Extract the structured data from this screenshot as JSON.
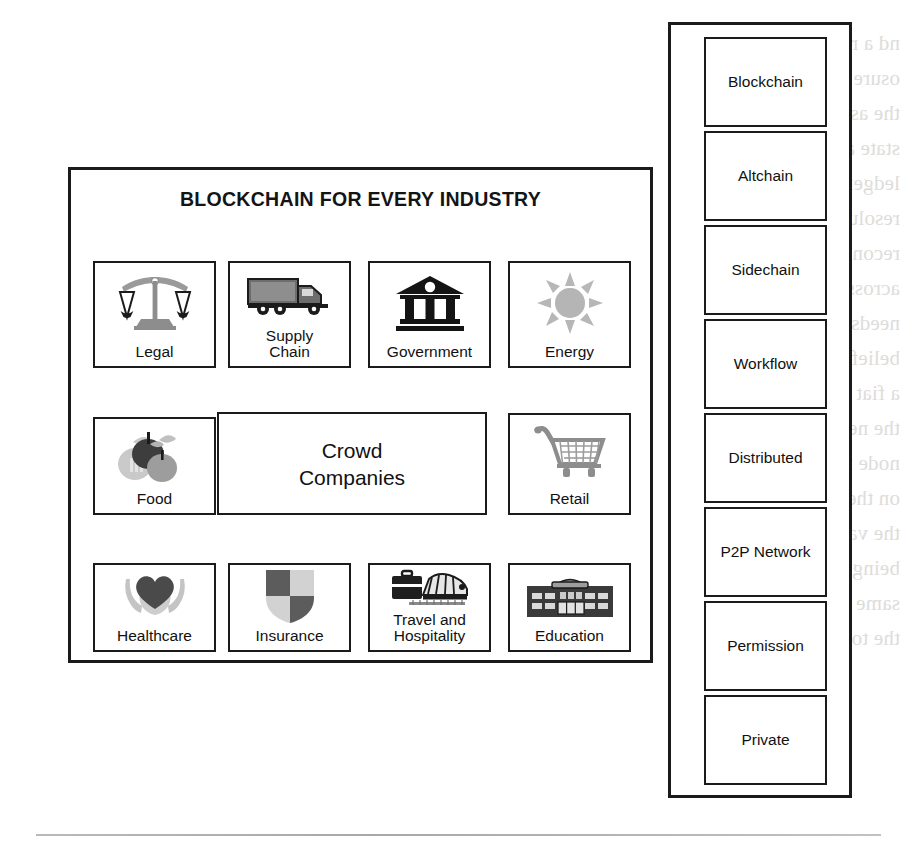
{
  "page": {
    "background_color": "#ffffff",
    "ink_color": "#1b1b1b",
    "ghost_text_color": "#d9d7d4",
    "ghost_text_right": "nd a reconciliation\nosure that traces\nthe asset and its\nstate across each\nledger. Token\nresolution and\nreconciliation\nacross partners\nneeds a common\nbelief system like\na fiat currency of\nthe network. Each\nnode must agree\non the state and\nthe value that is\nbeing settled. The\nsame applies for\nthe token itself.",
    "ghost_text_mid": "objects that are required to build a ledger\nensuring cross-ledger token resolution and\nreconciliation across the partners in a\nnetwork. A common belief system like a fiat\ncurrency of the network is required."
  },
  "industry_panel": {
    "title": "BLOCKCHAIN FOR EVERY INDUSTRY",
    "rows": [
      {
        "cells": [
          {
            "id": "legal",
            "label": "Legal",
            "icon": "scales-of-justice-icon"
          },
          {
            "id": "supply",
            "label": "Supply\nChain",
            "icon": "delivery-truck-icon"
          },
          {
            "id": "government",
            "label": "Government",
            "icon": "classical-bank-building-icon"
          },
          {
            "id": "energy",
            "label": "Energy",
            "icon": "sun-icon"
          }
        ]
      },
      {
        "cells": [
          {
            "id": "food",
            "label": "Food",
            "icon": "fruit-apple-icon"
          },
          {
            "id": "crowd",
            "label": "Crowd\nCompanies",
            "icon": "none"
          },
          {
            "id": "retail",
            "label": "Retail",
            "icon": "shopping-cart-icon"
          }
        ]
      },
      {
        "cells": [
          {
            "id": "healthcare",
            "label": "Healthcare",
            "icon": "heart-in-hands-icon"
          },
          {
            "id": "insurance",
            "label": "Insurance",
            "icon": "shield-icon"
          },
          {
            "id": "travel",
            "label": "Travel and\nHospitality",
            "icon": "briefcase-train-icon"
          },
          {
            "id": "education",
            "label": "Education",
            "icon": "school-building-icon"
          }
        ]
      }
    ]
  },
  "type_panel": {
    "items": [
      {
        "label": "Blockchain"
      },
      {
        "label": "Altchain"
      },
      {
        "label": "Sidechain"
      },
      {
        "label": "Workflow"
      },
      {
        "label": "Distributed"
      },
      {
        "label": "P2P Network"
      },
      {
        "label": "Permission"
      },
      {
        "label": "Private"
      }
    ]
  }
}
